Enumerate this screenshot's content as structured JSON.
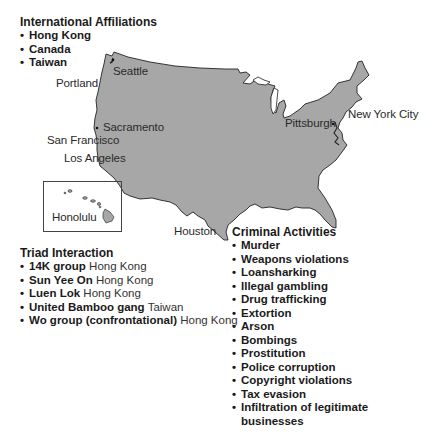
{
  "map": {
    "fill_color": "#a7a7a7",
    "outline_color": "#222222",
    "cities": [
      {
        "name": "Seattle"
      },
      {
        "name": "Portland"
      },
      {
        "name": "Sacramento"
      },
      {
        "name": "San Francisco"
      },
      {
        "name": "Los Angeles"
      },
      {
        "name": "Honolulu"
      },
      {
        "name": "Houston"
      },
      {
        "name": "Pittsburgh"
      },
      {
        "name": "New York City"
      }
    ]
  },
  "international_affiliations": {
    "title": "International Affiliations",
    "items": [
      "Hong Kong",
      "Canada",
      "Taiwan"
    ]
  },
  "triad_interaction": {
    "title": "Triad Interaction",
    "items": [
      {
        "group": "14K group",
        "location": "Hong Kong"
      },
      {
        "group": "Sun Yee On",
        "location": "Hong Kong"
      },
      {
        "group": "Luen Lok",
        "location": "Hong Kong"
      },
      {
        "group": "United Bamboo gang",
        "location": "Taiwan"
      },
      {
        "group": "Wo group (confrontational)",
        "location": "Hong Kong"
      }
    ]
  },
  "criminal_activities": {
    "title": "Criminal Activities",
    "items": [
      "Murder",
      "Weapons violations",
      "Loansharking",
      "Illegal gambling",
      "Drug trafficking",
      "Extortion",
      "Arson",
      "Bombings",
      "Prostitution",
      "Police corruption",
      "Copyright violations",
      "Tax evasion",
      "Infiltration of legitimate businesses"
    ]
  },
  "bullet": "•"
}
